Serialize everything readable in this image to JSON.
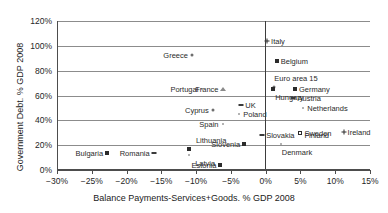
{
  "chart_data": {
    "type": "scatter",
    "title": "",
    "xlabel": "Balance Payments-Services+Goods. % GDP 2008",
    "ylabel": "Government Debt. % GDP 2008",
    "xlim": [
      -30,
      15
    ],
    "ylim": [
      0,
      120
    ],
    "xticks": [
      "−30%",
      "−25%",
      "−20%",
      "−15%",
      "−10%",
      "−5%",
      "0%",
      "5%",
      "10%",
      "15%"
    ],
    "xtick_values": [
      -30,
      -25,
      -20,
      -15,
      -10,
      -5,
      0,
      5,
      10,
      15
    ],
    "yticks": [
      "0%",
      "20%",
      "40%",
      "60%",
      "80%",
      "100%",
      "120%"
    ],
    "ytick_values": [
      0,
      20,
      40,
      60,
      80,
      100,
      120
    ],
    "grid": true,
    "legend": "none",
    "zero_reference_line_x": 0,
    "points": [
      {
        "name": "Italy",
        "x": 0.2,
        "y": 104,
        "marker": "plus",
        "label_side": "right"
      },
      {
        "name": "Greece",
        "x": -10.6,
        "y": 93,
        "marker": "dot",
        "label_side": "left"
      },
      {
        "name": "Belgium",
        "x": 1.6,
        "y": 88,
        "marker": "square",
        "label_side": "right"
      },
      {
        "name": "Euro area 15",
        "x": 1.2,
        "y": 67,
        "marker": "dot",
        "label_side": "above"
      },
      {
        "name": "Hungary",
        "x": 1.1,
        "y": 65,
        "marker": "square",
        "label_side": "below"
      },
      {
        "name": "Portugal",
        "x": -9.1,
        "y": 65,
        "marker": "tiny",
        "label_side": "left"
      },
      {
        "name": "France",
        "x": -6.2,
        "y": 65,
        "marker": "tri",
        "label_side": "left"
      },
      {
        "name": "Germany",
        "x": 4.2,
        "y": 65,
        "marker": "square",
        "label_side": "right"
      },
      {
        "name": "Austria",
        "x": 4.0,
        "y": 58,
        "marker": "dash",
        "label_side": "right"
      },
      {
        "name": "Netherlands",
        "x": 5.4,
        "y": 50,
        "marker": "tiny",
        "label_side": "right"
      },
      {
        "name": "UK",
        "x": -3.5,
        "y": 52,
        "marker": "dash",
        "label_side": "right"
      },
      {
        "name": "Cyprus",
        "x": -7.6,
        "y": 48,
        "marker": "dot",
        "label_side": "left"
      },
      {
        "name": "Poland",
        "x": -3.8,
        "y": 45,
        "marker": "tiny",
        "label_side": "right"
      },
      {
        "name": "Spain",
        "x": -6.2,
        "y": 37,
        "marker": "tiny",
        "label_side": "left"
      },
      {
        "name": "Ireland",
        "x": 11.2,
        "y": 31,
        "marker": "plus",
        "label_side": "right"
      },
      {
        "name": "Sweden",
        "x": 5.0,
        "y": 30,
        "marker": "open",
        "label_side": "right"
      },
      {
        "name": "Finland",
        "x": 5.0,
        "y": 28,
        "marker": "none",
        "label_side": "right"
      },
      {
        "name": "Slovakia",
        "x": -0.5,
        "y": 28,
        "marker": "dash",
        "label_side": "right"
      },
      {
        "name": "Denmark",
        "x": 2.2,
        "y": 21,
        "marker": "tiny",
        "label_side": "below"
      },
      {
        "name": "Slovenia",
        "x": -3.1,
        "y": 21,
        "marker": "square",
        "label_side": "left"
      },
      {
        "name": "Lithuania",
        "x": -11.0,
        "y": 17,
        "marker": "square",
        "label_side": "above"
      },
      {
        "name": "Bulgaria",
        "x": -22.8,
        "y": 14,
        "marker": "square",
        "label_side": "left"
      },
      {
        "name": "Romania",
        "x": -16.1,
        "y": 14,
        "marker": "dash",
        "label_side": "left"
      },
      {
        "name": "Latvia",
        "x": -11.0,
        "y": 12,
        "marker": "tiny",
        "label_side": "below"
      },
      {
        "name": "Estonia",
        "x": -6.5,
        "y": 4,
        "marker": "square",
        "label_side": "left"
      }
    ]
  }
}
